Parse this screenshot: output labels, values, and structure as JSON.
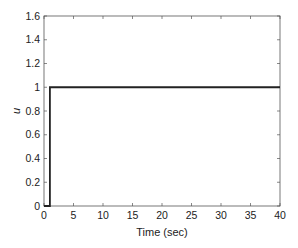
{
  "chart_data": {
    "type": "line",
    "title": "",
    "xlabel": "Time (sec)",
    "ylabel": "u",
    "xlim": [
      0,
      40
    ],
    "ylim": [
      0,
      1.6
    ],
    "xticks": [
      0,
      5,
      10,
      15,
      20,
      25,
      30,
      35,
      40
    ],
    "yticks": [
      0,
      0.2,
      0.4,
      0.6,
      0.8,
      1,
      1.2,
      1.4,
      1.6
    ],
    "xtick_labels": [
      "0",
      "5",
      "10",
      "15",
      "20",
      "25",
      "30",
      "35",
      "40"
    ],
    "ytick_labels": [
      "0",
      "0.2",
      "0.4",
      "0.6",
      "0.8",
      "1",
      "1.2",
      "1.4",
      "1.6"
    ],
    "grid": false,
    "legend": null,
    "series": [
      {
        "name": "u",
        "x": [
          0,
          1,
          1,
          40
        ],
        "y": [
          0,
          0,
          1,
          1
        ],
        "color": "#222222"
      }
    ]
  },
  "colors": {
    "axes": "#555555",
    "line": "#222222",
    "background": "#ffffff"
  }
}
